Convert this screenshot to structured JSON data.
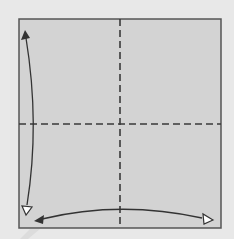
{
  "diagram": {
    "type": "origami-step",
    "colors": {
      "background": "#e8e8e8",
      "paper": "#d3d3d3",
      "border": "#555555",
      "fold_line": "#3a3a3a",
      "arrow": "#333333",
      "arrow_hollow_fill": "#ffffff"
    },
    "square": {
      "x": 19,
      "y": 19,
      "width": 202,
      "height": 209
    },
    "fold_lines": [
      {
        "orientation": "vertical",
        "x": 120,
        "style": "dashed",
        "kind": "valley"
      },
      {
        "orientation": "horizontal",
        "y": 124,
        "style": "dashed",
        "kind": "valley"
      }
    ],
    "arrows": [
      {
        "name": "vertical-fold-unfold-arrow",
        "direction": "top-bottom",
        "curve": "left-edge",
        "heads": [
          "filled",
          "hollow"
        ]
      },
      {
        "name": "horizontal-fold-unfold-arrow",
        "direction": "left-right",
        "curve": "bottom-edge",
        "heads": [
          "filled",
          "hollow"
        ]
      }
    ]
  }
}
